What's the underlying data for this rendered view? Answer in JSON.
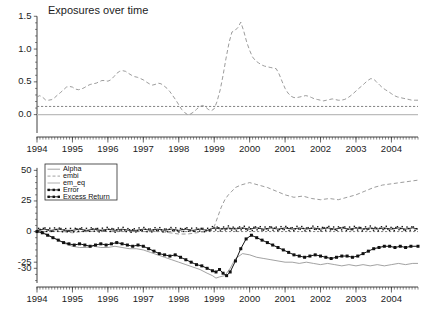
{
  "figure": {
    "width": 422,
    "height": 313,
    "background": "#ffffff"
  },
  "chart_data": [
    {
      "id": "top-panel",
      "type": "line",
      "title": "Exposures over time",
      "xlabel": "",
      "ylabel": "",
      "xlim": [
        1994.0,
        2004.75
      ],
      "ylim": [
        -0.28,
        1.55
      ],
      "grid": false,
      "legend": "none",
      "xticks": [
        1994,
        1995,
        1996,
        1997,
        1998,
        1999,
        2000,
        2001,
        2002,
        2003,
        2004
      ],
      "xticklabels": [
        "1994",
        "1995",
        "1996",
        "1997",
        "1998",
        "1999",
        "2000",
        "2001",
        "2002",
        "2003",
        "2004"
      ],
      "yticks": [
        0.0,
        0.5,
        1.0,
        1.5
      ],
      "yticklabels": [
        "0.0",
        "0.5",
        "1.0",
        "1.5"
      ],
      "annotations": [
        {
          "name": "zero-reference-line",
          "y": 0.0,
          "style": "solid-light-gray"
        },
        {
          "name": "embi-flat-dashed-line",
          "y": 0.125,
          "style": "dotted-gray"
        }
      ],
      "series": [
        {
          "name": "embi",
          "style": "dashed",
          "color": "#8a8a8a",
          "x": [
            1994.0,
            1994.08,
            1994.17,
            1994.25,
            1994.33,
            1994.42,
            1994.5,
            1994.58,
            1994.67,
            1994.75,
            1994.83,
            1994.92,
            1995.0,
            1995.08,
            1995.17,
            1995.25,
            1995.33,
            1995.42,
            1995.5,
            1995.58,
            1995.67,
            1995.75,
            1995.83,
            1995.92,
            1996.0,
            1996.08,
            1996.17,
            1996.25,
            1996.33,
            1996.42,
            1996.5,
            1996.58,
            1996.67,
            1996.75,
            1996.83,
            1996.92,
            1997.0,
            1997.08,
            1997.17,
            1997.25,
            1997.33,
            1997.42,
            1997.5,
            1997.58,
            1997.67,
            1997.75,
            1997.83,
            1997.92,
            1998.0,
            1998.08,
            1998.17,
            1998.25,
            1998.33,
            1998.42,
            1998.5,
            1998.58,
            1998.67,
            1998.75,
            1998.83,
            1998.92,
            1999.0,
            1999.08,
            1999.17,
            1999.25,
            1999.33,
            1999.42,
            1999.5,
            1999.58,
            1999.67,
            1999.75,
            1999.83,
            1999.92,
            2000.0,
            2000.08,
            2000.17,
            2000.25,
            2000.33,
            2000.42,
            2000.5,
            2000.58,
            2000.67,
            2000.75,
            2000.83,
            2000.92,
            2001.0,
            2001.08,
            2001.17,
            2001.25,
            2001.33,
            2001.42,
            2001.5,
            2001.58,
            2001.67,
            2001.75,
            2001.83,
            2001.92,
            2002.0,
            2002.08,
            2002.17,
            2002.25,
            2002.33,
            2002.42,
            2002.5,
            2002.58,
            2002.67,
            2002.75,
            2002.83,
            2002.92,
            2003.0,
            2003.08,
            2003.17,
            2003.25,
            2003.33,
            2003.42,
            2003.5,
            2003.58,
            2003.67,
            2003.75,
            2003.83,
            2003.92,
            2004.0,
            2004.08,
            2004.17,
            2004.25,
            2004.33,
            2004.42,
            2004.5,
            2004.58,
            2004.67,
            2004.75
          ],
          "y": [
            0.27,
            0.29,
            0.26,
            0.22,
            0.22,
            0.23,
            0.26,
            0.3,
            0.34,
            0.38,
            0.42,
            0.43,
            0.42,
            0.39,
            0.38,
            0.39,
            0.41,
            0.44,
            0.46,
            0.47,
            0.48,
            0.5,
            0.52,
            0.52,
            0.51,
            0.53,
            0.58,
            0.63,
            0.66,
            0.67,
            0.66,
            0.63,
            0.6,
            0.58,
            0.57,
            0.55,
            0.53,
            0.5,
            0.47,
            0.45,
            0.46,
            0.48,
            0.47,
            0.44,
            0.4,
            0.35,
            0.29,
            0.22,
            0.15,
            0.08,
            0.03,
            0.0,
            0.01,
            0.04,
            0.08,
            0.12,
            0.14,
            0.12,
            0.08,
            0.06,
            0.09,
            0.2,
            0.38,
            0.6,
            0.85,
            1.1,
            1.26,
            1.28,
            1.33,
            1.41,
            1.28,
            1.1,
            0.98,
            0.88,
            0.82,
            0.79,
            0.76,
            0.74,
            0.73,
            0.72,
            0.71,
            0.7,
            0.62,
            0.5,
            0.4,
            0.33,
            0.28,
            0.26,
            0.26,
            0.27,
            0.28,
            0.29,
            0.28,
            0.26,
            0.24,
            0.23,
            0.22,
            0.21,
            0.22,
            0.23,
            0.24,
            0.23,
            0.22,
            0.22,
            0.23,
            0.25,
            0.28,
            0.32,
            0.36,
            0.4,
            0.44,
            0.48,
            0.52,
            0.55,
            0.54,
            0.5,
            0.45,
            0.41,
            0.38,
            0.35,
            0.32,
            0.29,
            0.27,
            0.26,
            0.25,
            0.24,
            0.23,
            0.22,
            0.22,
            0.22
          ]
        }
      ]
    },
    {
      "id": "bottom-panel",
      "type": "line",
      "title": "",
      "xlabel": "",
      "ylabel": "",
      "xlim": [
        1994.0,
        2004.75
      ],
      "ylim": [
        -42,
        56
      ],
      "grid": false,
      "legend": "upper-left",
      "legend_entries": [
        {
          "label": "Alpha",
          "style": "solid",
          "color": "#8a8a8a",
          "marker": "none"
        },
        {
          "label": "embi",
          "style": "dashed",
          "color": "#8a8a8a",
          "marker": "none"
        },
        {
          "label": "em_eq",
          "style": "solid",
          "color": "#9a9a9a",
          "marker": "none"
        },
        {
          "label": "Error",
          "style": "solid",
          "color": "#111111",
          "marker": "star"
        },
        {
          "label": "Excess Return",
          "style": "solid",
          "color": "#111111",
          "marker": "square"
        }
      ],
      "xticks": [
        1994,
        1995,
        1996,
        1997,
        1998,
        1999,
        2000,
        2001,
        2002,
        2003,
        2004
      ],
      "xticklabels": [
        "1994",
        "1995",
        "1996",
        "1997",
        "1998",
        "1999",
        "2000",
        "2001",
        "2002",
        "2003",
        "2004"
      ],
      "yticks": [
        -30,
        -25,
        0,
        25,
        50
      ],
      "yticklabels": [
        "-30",
        "-25",
        "0",
        "25",
        "50"
      ],
      "series": [
        {
          "name": "embi",
          "style": "dashed",
          "color": "#8a8a8a",
          "x": [
            1994.0,
            1994.25,
            1994.5,
            1994.75,
            1995.0,
            1995.25,
            1995.5,
            1995.75,
            1996.0,
            1996.25,
            1996.5,
            1996.75,
            1997.0,
            1997.25,
            1997.5,
            1997.75,
            1998.0,
            1998.25,
            1998.5,
            1998.75,
            1999.0,
            1999.1,
            1999.2,
            1999.3,
            1999.4,
            1999.5,
            1999.6,
            1999.75,
            2000.0,
            2000.25,
            2000.5,
            2000.75,
            2001.0,
            2001.25,
            2001.5,
            2001.75,
            2002.0,
            2002.25,
            2002.5,
            2002.75,
            2003.0,
            2003.25,
            2003.5,
            2003.75,
            2004.0,
            2004.25,
            2004.5,
            2004.75
          ],
          "y": [
            1,
            0,
            0,
            0,
            -1,
            0,
            0,
            1,
            0,
            0,
            0,
            0,
            0,
            0,
            0,
            -1,
            -2,
            -2,
            -1,
            0,
            4,
            12,
            20,
            26,
            30,
            33,
            36,
            38,
            40,
            38,
            36,
            33,
            30,
            28,
            29,
            27,
            26,
            27,
            26,
            28,
            30,
            33,
            36,
            38,
            39,
            40,
            41,
            42
          ]
        },
        {
          "name": "Error",
          "style": "solid-marker",
          "marker": "star",
          "color": "#111111",
          "x": [
            1994.0,
            1994.2,
            1994.4,
            1994.6,
            1994.8,
            1995.0,
            1995.2,
            1995.4,
            1995.6,
            1995.8,
            1996.0,
            1996.2,
            1996.4,
            1996.6,
            1996.8,
            1997.0,
            1997.2,
            1997.4,
            1997.6,
            1997.8,
            1998.0,
            1998.2,
            1998.4,
            1998.6,
            1998.8,
            1999.0,
            1999.2,
            1999.4,
            1999.6,
            1999.8,
            2000.0,
            2000.2,
            2000.4,
            2000.6,
            2000.8,
            2001.0,
            2001.2,
            2001.4,
            2001.6,
            2001.8,
            2002.0,
            2002.2,
            2002.4,
            2002.6,
            2002.8,
            2003.0,
            2003.2,
            2003.4,
            2003.6,
            2003.8,
            2004.0,
            2004.2,
            2004.4,
            2004.6,
            2004.75
          ],
          "y": [
            1,
            2,
            1,
            2,
            1,
            1,
            2,
            1,
            2,
            1,
            2,
            1,
            2,
            1,
            1,
            2,
            1,
            2,
            1,
            2,
            1,
            2,
            1,
            2,
            1,
            3,
            2,
            3,
            2,
            3,
            2,
            3,
            2,
            3,
            2,
            3,
            2,
            3,
            2,
            3,
            2,
            3,
            2,
            3,
            2,
            3,
            2,
            3,
            2,
            3,
            2,
            3,
            2,
            3,
            2
          ]
        },
        {
          "name": "Excess Return",
          "style": "solid-marker",
          "marker": "square",
          "color": "#111111",
          "x": [
            1994.0,
            1994.15,
            1994.3,
            1994.45,
            1994.6,
            1994.75,
            1994.9,
            1995.05,
            1995.2,
            1995.35,
            1995.5,
            1995.65,
            1995.8,
            1995.95,
            1996.1,
            1996.25,
            1996.4,
            1996.55,
            1996.7,
            1996.85,
            1997.0,
            1997.15,
            1997.3,
            1997.45,
            1997.6,
            1997.75,
            1997.9,
            1998.05,
            1998.2,
            1998.35,
            1998.5,
            1998.65,
            1998.8,
            1998.95,
            1999.05,
            1999.15,
            1999.25,
            1999.35,
            1999.45,
            1999.6,
            1999.75,
            1999.9,
            2000.05,
            2000.2,
            2000.35,
            2000.5,
            2000.65,
            2000.8,
            2000.95,
            2001.1,
            2001.25,
            2001.4,
            2001.55,
            2001.7,
            2001.85,
            2002.0,
            2002.15,
            2002.3,
            2002.45,
            2002.6,
            2002.75,
            2002.9,
            2003.05,
            2003.2,
            2003.35,
            2003.5,
            2003.65,
            2003.8,
            2003.95,
            2004.1,
            2004.25,
            2004.4,
            2004.55,
            2004.75
          ],
          "y": [
            0,
            -1,
            -3,
            -5,
            -7,
            -9,
            -10,
            -11,
            -10,
            -11,
            -12,
            -11,
            -10,
            -11,
            -10,
            -9,
            -10,
            -11,
            -12,
            -11,
            -12,
            -14,
            -16,
            -18,
            -19,
            -20,
            -19,
            -21,
            -23,
            -25,
            -27,
            -28,
            -30,
            -32,
            -33,
            -31,
            -34,
            -36,
            -33,
            -24,
            -14,
            -6,
            -3,
            -5,
            -7,
            -9,
            -11,
            -13,
            -15,
            -17,
            -19,
            -20,
            -21,
            -20,
            -19,
            -20,
            -21,
            -22,
            -21,
            -20,
            -20,
            -21,
            -20,
            -18,
            -16,
            -14,
            -13,
            -12,
            -12,
            -13,
            -12,
            -13,
            -12,
            -12
          ]
        },
        {
          "name": "Alpha",
          "style": "solid",
          "color": "#8a8a8a",
          "x": [
            1994.0,
            1994.2,
            1994.4,
            1994.6,
            1994.8,
            1995.0,
            1995.2,
            1995.4,
            1995.6,
            1995.8,
            1996.0,
            1996.2,
            1996.4,
            1996.6,
            1996.8,
            1997.0,
            1997.2,
            1997.4,
            1997.6,
            1997.8,
            1998.0,
            1998.2,
            1998.4,
            1998.6,
            1998.8,
            1998.95,
            1999.05,
            1999.15,
            1999.3,
            1999.45,
            1999.6,
            1999.8,
            2000.0,
            2000.2,
            2000.4,
            2000.6,
            2000.8,
            2001.0,
            2001.2,
            2001.4,
            2001.6,
            2001.8,
            2002.0,
            2002.2,
            2002.4,
            2002.6,
            2002.8,
            2003.0,
            2003.2,
            2003.4,
            2003.6,
            2003.8,
            2004.0,
            2004.2,
            2004.4,
            2004.6,
            2004.75
          ],
          "y": [
            1,
            -1,
            -4,
            -7,
            -10,
            -12,
            -13,
            -13,
            -12,
            -13,
            -13,
            -12,
            -13,
            -14,
            -14,
            -15,
            -17,
            -19,
            -21,
            -23,
            -25,
            -27,
            -29,
            -31,
            -34,
            -36,
            -38,
            -37,
            -36,
            -30,
            -22,
            -18,
            -19,
            -21,
            -22,
            -23,
            -24,
            -25,
            -25,
            -26,
            -25,
            -26,
            -27,
            -26,
            -27,
            -28,
            -27,
            -28,
            -27,
            -28,
            -27,
            -28,
            -27,
            -26,
            -27,
            -26,
            -26
          ]
        }
      ]
    }
  ]
}
